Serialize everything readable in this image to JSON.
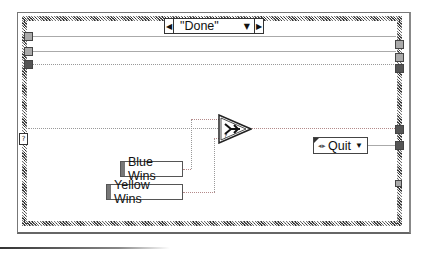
{
  "diagram": {
    "type": "LabVIEW block diagram",
    "structure": "while-loop with case structure",
    "case_selector": {
      "value": "\"Done\"",
      "prev_icon": "◀",
      "next_icon": "▶",
      "dropdown_icon": "▼"
    },
    "constants": {
      "blue_wins": "Blue Wins",
      "yellow_wins": "Yellow Wins"
    },
    "select_node": {
      "name": "Select",
      "glyph": "?"
    },
    "enum_constant": {
      "value": "Quit",
      "arrows_icon": "◂▸",
      "dropdown_icon": "▼"
    },
    "condition_terminal": "?"
  }
}
